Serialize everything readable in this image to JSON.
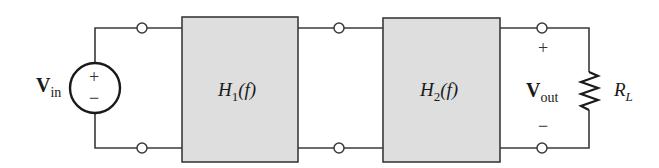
{
  "diagram": {
    "type": "cascaded two-port network",
    "colors": {
      "wire": "#3a3a3a",
      "block_fill": "#dedede",
      "block_stroke": "#3a3a3a",
      "background": "#ffffff"
    },
    "source": {
      "label_main": "V",
      "label_sub": "in",
      "plus": "+",
      "minus": "−"
    },
    "blocks": [
      {
        "label_main": "H",
        "label_sub": "1",
        "label_arg": "(f)"
      },
      {
        "label_main": "H",
        "label_sub": "2",
        "label_arg": "(f)"
      }
    ],
    "output": {
      "label_main": "V",
      "label_sub": "out",
      "plus": "+",
      "minus": "−"
    },
    "load": {
      "label_main": "R",
      "label_sub": "L"
    }
  }
}
